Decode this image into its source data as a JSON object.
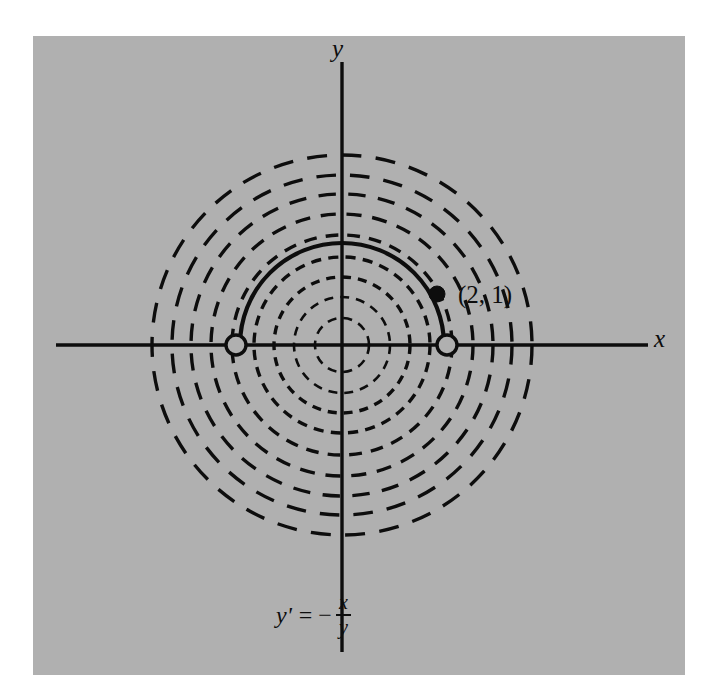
{
  "figure": {
    "background_color": "#b0b0b0",
    "ink_color": "#0d0d0d",
    "panel": {
      "left": 33,
      "top": 36,
      "width": 652,
      "height": 639
    },
    "axes": {
      "x_label": "x",
      "y_label": "y",
      "origin": {
        "x": 342,
        "y": 345
      },
      "x_axis_from": {
        "x": 56,
        "y": 345
      },
      "x_axis_to": {
        "x": 648,
        "y": 345
      },
      "y_axis_from": {
        "x": 342,
        "y": 62
      },
      "y_axis_to": {
        "x": 342,
        "y": 652
      }
    },
    "point_label": "(2, 1)",
    "equation": {
      "lhs": "y'",
      "equals": "=",
      "minus": "−",
      "numerator": "x",
      "denominator": "y"
    },
    "markers": {
      "filled_point": {
        "x": 437,
        "y": 294,
        "radius": 8,
        "style": "filled"
      },
      "open_point_right": {
        "x": 447,
        "y": 345,
        "radius": 10,
        "style": "open"
      },
      "open_point_left": {
        "x": 236,
        "y": 345,
        "radius": 10,
        "style": "open"
      }
    }
  },
  "chart_data": {
    "type": "line",
    "xlabel": "x",
    "ylabel": "y",
    "center": {
      "x": 0,
      "y": 0
    },
    "grid": false,
    "legend": null,
    "dashed_family": {
      "name": "general solution circles",
      "style": "dashed",
      "radii_px": [
        27,
        48,
        68,
        88,
        110,
        131,
        151,
        170,
        190
      ]
    },
    "solid_curve": {
      "name": "particular solution through (2, 1)",
      "style": "solid",
      "radius_px": 102,
      "arc_start_deg": 0,
      "arc_end_deg": 180,
      "passes_through": {
        "x": 2,
        "y": 1
      }
    },
    "annotations": [
      {
        "text": "(2, 1)",
        "x_px": 458,
        "y_px": 282
      },
      {
        "text": "y' = -x/y",
        "x_px": 276,
        "y_px": 592
      }
    ]
  }
}
